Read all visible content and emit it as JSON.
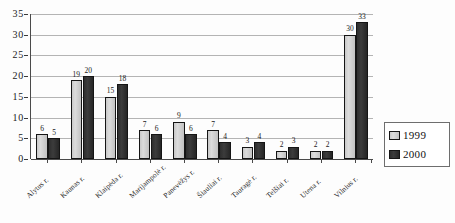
{
  "chart_data": {
    "type": "bar",
    "title": "",
    "subtitle": "",
    "xlabel": "",
    "ylabel": "",
    "ylim": [
      0,
      35
    ],
    "ytick_step": 5,
    "yticks": [
      0,
      5,
      10,
      15,
      20,
      25,
      30,
      35
    ],
    "grid": true,
    "legend_position": "right",
    "categories": [
      "Alytus r.",
      "Kaunas r.",
      "Klaipėda r.",
      "Marijampolė r.",
      "Panevėžys r.",
      "Šiauliai r.",
      "Tauragė r.",
      "Telšiai r.",
      "Utena r.",
      "Vilnius r."
    ],
    "series": [
      {
        "name": "1999",
        "color": "#d0d0d0",
        "values": [
          6,
          19,
          15,
          7,
          9,
          7,
          3,
          2,
          2,
          30
        ]
      },
      {
        "name": "2000",
        "color": "#333333",
        "values": [
          5,
          20,
          18,
          6,
          6,
          4,
          4,
          3,
          2,
          33
        ]
      }
    ]
  },
  "legend": {
    "entries": [
      {
        "label": "1999",
        "swatch": "light-gray-swatch"
      },
      {
        "label": "2000",
        "swatch": "dark-gray-swatch"
      }
    ]
  },
  "colors": {
    "series_1999": "#d0d0d0",
    "series_2000": "#333333",
    "gridline": "#b4b4b4",
    "axis": "#4a4a4a",
    "text": "#1a1a1a",
    "background": "#fdfdfd"
  }
}
